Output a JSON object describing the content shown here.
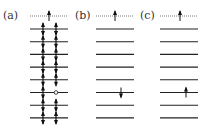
{
  "figure": {
    "colors": {
      "line": "#222222",
      "dotted_line": "#555555",
      "arrow": "#111111",
      "background": "#ffffff"
    },
    "panels": [
      {
        "id": "a",
        "label": "(a)",
        "top_level": {
          "style": "dotted",
          "electrons": [
            "up"
          ]
        },
        "levels": [
          {
            "style": "solid",
            "electrons": [
              "pair",
              "pair"
            ]
          },
          {
            "style": "solid",
            "electrons": [
              "pair",
              "pair"
            ]
          },
          {
            "style": "solid",
            "electrons": [
              "pair",
              "pair"
            ]
          },
          {
            "style": "solid",
            "electrons": [
              "pair",
              "pair"
            ]
          },
          {
            "style": "solid",
            "electrons": [
              "pair",
              "pair"
            ]
          },
          {
            "style": "solid",
            "electrons": [
              "pair",
              "hole"
            ]
          },
          {
            "style": "solid",
            "electrons": [
              "pair",
              "pair"
            ]
          },
          {
            "style": "solid",
            "electrons": [
              "pair",
              "pair"
            ]
          }
        ]
      },
      {
        "id": "b",
        "label": "(b)",
        "top_level": {
          "style": "dotted",
          "electrons": [
            "up"
          ]
        },
        "levels": [
          {
            "style": "solid",
            "electrons": []
          },
          {
            "style": "solid",
            "electrons": []
          },
          {
            "style": "solid",
            "electrons": []
          },
          {
            "style": "solid",
            "electrons": []
          },
          {
            "style": "solid",
            "electrons": []
          },
          {
            "style": "solid",
            "electrons": [
              "down"
            ]
          },
          {
            "style": "solid",
            "electrons": []
          },
          {
            "style": "solid",
            "electrons": []
          }
        ]
      },
      {
        "id": "c",
        "label": "(c)",
        "top_level": {
          "style": "dotted",
          "electrons": [
            "up"
          ]
        },
        "levels": [
          {
            "style": "solid",
            "electrons": []
          },
          {
            "style": "solid",
            "electrons": []
          },
          {
            "style": "solid",
            "electrons": []
          },
          {
            "style": "solid",
            "electrons": []
          },
          {
            "style": "solid",
            "electrons": []
          },
          {
            "style": "solid",
            "electrons": [
              "up"
            ]
          },
          {
            "style": "solid",
            "electrons": []
          },
          {
            "style": "solid",
            "electrons": []
          }
        ]
      }
    ]
  }
}
